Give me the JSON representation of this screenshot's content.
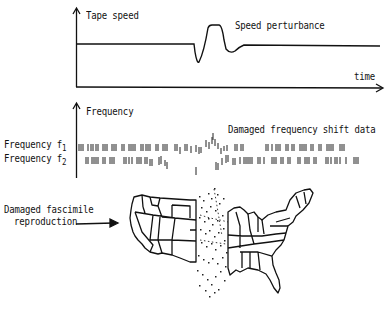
{
  "diagram": {
    "panel_speed": {
      "y_axis_label": "Tape speed",
      "x_axis_label": "time",
      "annotation": "Speed perturbance"
    },
    "panel_frequency": {
      "y_axis_label": "Frequency",
      "annotation": "Damaged frequency shift data",
      "rows": [
        {
          "label": "Frequency f",
          "subscript": "1"
        },
        {
          "label": "Frequency f",
          "subscript": "2"
        }
      ]
    },
    "panel_map": {
      "label_line1": "Damaged fascimile",
      "label_line2": "reproduction"
    },
    "colors": {
      "ink": "#111111",
      "background": "#ffffff"
    }
  }
}
